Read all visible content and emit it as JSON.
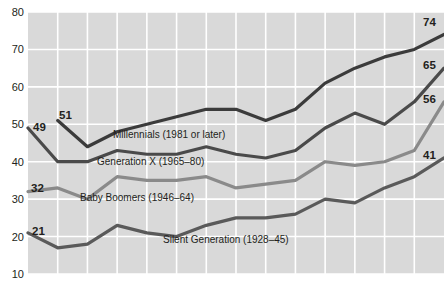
{
  "chart_data": {
    "type": "line",
    "title": "",
    "subtitle": "",
    "xlabel": "",
    "ylabel": "",
    "ylim": [
      10,
      80
    ],
    "yticks": [
      10,
      20,
      30,
      40,
      50,
      60,
      70,
      80
    ],
    "ytick_labels": [
      "10",
      "20",
      "30",
      "40",
      "50",
      "60",
      "70",
      "80"
    ],
    "xticks": [],
    "xtick_labels": [],
    "grid": true,
    "legend_position": "inline-annotations",
    "plot_background": "#d9d9d9",
    "gridline_color": "#ffffff",
    "series": [
      {
        "name": "Millennials (1981 or later)",
        "label": "Millennials (1981 or later)",
        "color": "#3b3b3b",
        "start_label": "51",
        "end_label": "74",
        "x": [
          1,
          2,
          3,
          4,
          5,
          6,
          7,
          8,
          9,
          10,
          11,
          12,
          13,
          14
        ],
        "values": [
          51,
          44,
          48,
          50,
          52,
          54,
          54,
          51,
          54,
          61,
          65,
          68,
          70,
          74
        ]
      },
      {
        "name": "Generation X (1965-80)",
        "label": "Generation X (1965–80)",
        "color": "#4a4a4a",
        "start_label": "49",
        "end_label": "65",
        "x": [
          0,
          1,
          2,
          3,
          4,
          5,
          6,
          7,
          8,
          9,
          10,
          11,
          12,
          13,
          14
        ],
        "values": [
          49,
          40,
          40,
          43,
          42,
          42,
          44,
          42,
          41,
          43,
          49,
          53,
          50,
          56,
          65
        ]
      },
      {
        "name": "Baby Boomers (1946-64)",
        "label": "Baby Boomers (1946–64)",
        "color": "#8a8a8a",
        "start_label": "32",
        "end_label": "56",
        "x": [
          0,
          1,
          2,
          3,
          4,
          5,
          6,
          7,
          8,
          9,
          10,
          11,
          12,
          13,
          14
        ],
        "values": [
          32,
          33,
          30,
          36,
          35,
          35,
          36,
          33,
          34,
          35,
          40,
          39,
          40,
          43,
          56
        ]
      },
      {
        "name": "Silent Generation (1928-45)",
        "label": "Silent Generation (1928–45)",
        "color": "#5a5a5a",
        "start_label": "21",
        "end_label": "41",
        "x": [
          0,
          1,
          2,
          3,
          4,
          5,
          6,
          7,
          8,
          9,
          10,
          11,
          12,
          13,
          14
        ],
        "values": [
          21,
          17,
          18,
          23,
          21,
          20,
          23,
          25,
          25,
          26,
          30,
          29,
          33,
          36,
          41
        ]
      }
    ],
    "annotations": [
      {
        "text": "49",
        "series": "Generation X (1965-80)",
        "position": "start"
      },
      {
        "text": "51",
        "series": "Millennials (1981 or later)",
        "position": "start"
      },
      {
        "text": "32",
        "series": "Baby Boomers (1946-64)",
        "position": "start"
      },
      {
        "text": "21",
        "series": "Silent Generation (1928-45)",
        "position": "start"
      },
      {
        "text": "74",
        "series": "Millennials (1981 or later)",
        "position": "end"
      },
      {
        "text": "65",
        "series": "Generation X (1965-80)",
        "position": "end"
      },
      {
        "text": "56",
        "series": "Baby Boomers (1946-64)",
        "position": "end"
      },
      {
        "text": "41",
        "series": "Silent Generation (1928-45)",
        "position": "end"
      }
    ]
  },
  "axis": {
    "y_labels": [
      "80",
      "70",
      "60",
      "50",
      "40",
      "30",
      "20",
      "10"
    ]
  },
  "labels": {
    "millennials": "Millennials (1981 or later)",
    "genx": "Generation X (1965–80)",
    "boomers": "Baby Boomers (1946–64)",
    "silent": "Silent Generation (1928–45)",
    "start_49": "49",
    "start_51": "51",
    "start_32": "32",
    "start_21": "21",
    "end_74": "74",
    "end_65": "65",
    "end_56": "56",
    "end_41": "41"
  }
}
